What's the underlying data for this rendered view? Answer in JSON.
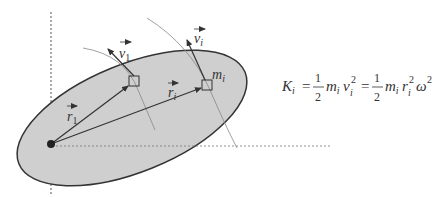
{
  "diagram": {
    "type": "rigid-body-rotation",
    "colors": {
      "body_fill": "#cfcfcf",
      "outline": "#333333",
      "guide": "#888888",
      "axes": "#555555"
    },
    "labels": {
      "v1": "v",
      "v1_sub": "1",
      "vi": "v",
      "vi_sub": "i",
      "r1": "r",
      "r1_sub": "1",
      "ri": "r",
      "ri_sub": "i",
      "mi": "m",
      "mi_sub": "i"
    },
    "equation": {
      "lhs": "K",
      "lhs_sub": "i",
      "eq1": "=",
      "frac1_num": "1",
      "frac1_den": "2",
      "term1": "m",
      "term1_sub": "i",
      "term1b": "v",
      "term1b_sub": "i",
      "term1b_sup": "2",
      "eq2": "=",
      "frac2_num": "1",
      "frac2_den": "2",
      "term2": "m",
      "term2_sub": "i",
      "term2b": "r",
      "term2b_sub": "i",
      "term2b_sup": "2",
      "term2c": "ω",
      "term2c_sup": "2"
    }
  }
}
